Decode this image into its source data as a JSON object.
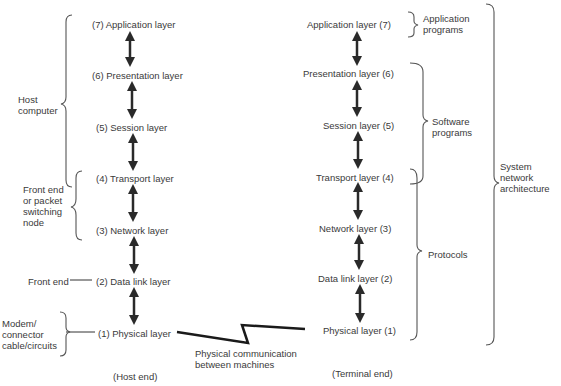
{
  "host": {
    "layers": [
      {
        "num": "(7)",
        "name": "Application layer",
        "label": "(7)  Application layer"
      },
      {
        "num": "(6)",
        "name": "Presentation layer",
        "label": "(6)  Presentation layer"
      },
      {
        "num": "(5)",
        "name": "Session layer",
        "label": "(5)  Session layer"
      },
      {
        "num": "(4)",
        "name": "Transport layer",
        "label": "(4)  Transport layer"
      },
      {
        "num": "(3)",
        "name": "Network layer",
        "label": "(3)  Network layer"
      },
      {
        "num": "(2)",
        "name": "Data link layer",
        "label": "(2)  Data link layer"
      },
      {
        "num": "(1)",
        "name": "Physical layer",
        "label": "(1)  Physical layer"
      }
    ],
    "groups": {
      "host_computer": "Host\ncomputer",
      "front_end_node": "Front end\nor packet\nswitching\nnode",
      "front_end": "Front end",
      "modem": "Modem/\nconnector\ncable/circuits"
    },
    "caption": "(Host end)"
  },
  "terminal": {
    "layers": [
      {
        "label": "Application layer (7)"
      },
      {
        "label": "Presentation layer (6)"
      },
      {
        "label": "Session layer  (5)"
      },
      {
        "label": "Transport layer (4)"
      },
      {
        "label": "Network layer  (3)"
      },
      {
        "label": "Data link layer  (2)"
      },
      {
        "label": "Physical layer  (1)"
      }
    ],
    "groups": {
      "application_programs": "Application\nprograms",
      "software_programs": "Software\nprograms",
      "protocols": "Protocols",
      "system_network_architecture": "System\nnetwork\narchitecture"
    },
    "caption": "(Terminal end)"
  },
  "link": {
    "label": "Physical communication\nbetween machines"
  },
  "colors": {
    "text": "#3a3a3a",
    "arrow": "#2a2a2a",
    "bracket": "#555555"
  }
}
